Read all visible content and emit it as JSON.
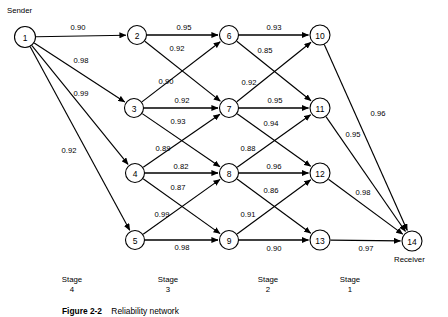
{
  "figure": {
    "sender_label": "Sender",
    "receiver_label": "Receiver",
    "caption_bold": "Figure  2-2",
    "caption_rest": "Reliability network"
  },
  "stages": [
    {
      "name": "Stage",
      "number": "4",
      "x": 72
    },
    {
      "name": "Stage",
      "number": "3",
      "x": 168
    },
    {
      "name": "Stage",
      "number": "2",
      "x": 268
    },
    {
      "name": "Stage",
      "number": "1",
      "x": 350
    }
  ],
  "chart_data": {
    "type": "diagram",
    "title": "Reliability network",
    "nodes": [
      {
        "id": "1",
        "label": "1",
        "x": 25,
        "y": 37,
        "r": 10.5,
        "role": "sender"
      },
      {
        "id": "2",
        "label": "2",
        "x": 137,
        "y": 35,
        "r": 9.5,
        "role": "intermediate"
      },
      {
        "id": "3",
        "label": "3",
        "x": 134,
        "y": 108,
        "r": 9.5,
        "role": "intermediate"
      },
      {
        "id": "4",
        "label": "4",
        "x": 135,
        "y": 173,
        "r": 9.5,
        "role": "intermediate"
      },
      {
        "id": "5",
        "label": "5",
        "x": 135,
        "y": 240,
        "r": 9.5,
        "role": "intermediate"
      },
      {
        "id": "6",
        "label": "6",
        "x": 229,
        "y": 35,
        "r": 9.5,
        "role": "intermediate"
      },
      {
        "id": "7",
        "label": "7",
        "x": 229,
        "y": 108,
        "r": 9.5,
        "role": "intermediate"
      },
      {
        "id": "8",
        "label": "8",
        "x": 229,
        "y": 173,
        "r": 9.5,
        "role": "intermediate"
      },
      {
        "id": "9",
        "label": "9",
        "x": 229,
        "y": 240,
        "r": 9.5,
        "role": "intermediate"
      },
      {
        "id": "10",
        "label": "10",
        "x": 320,
        "y": 35,
        "r": 10,
        "role": "intermediate"
      },
      {
        "id": "11",
        "label": "11",
        "x": 320,
        "y": 108,
        "r": 10,
        "role": "intermediate"
      },
      {
        "id": "12",
        "label": "12",
        "x": 320,
        "y": 173,
        "r": 10,
        "role": "intermediate"
      },
      {
        "id": "13",
        "label": "13",
        "x": 320,
        "y": 240,
        "r": 10,
        "role": "intermediate"
      },
      {
        "id": "14",
        "label": "14",
        "x": 412,
        "y": 241,
        "r": 10,
        "role": "receiver"
      }
    ],
    "edges": [
      {
        "from": "1",
        "to": "2",
        "value": "0.90",
        "lx": 78,
        "ly": 27
      },
      {
        "from": "1",
        "to": "3",
        "value": "0.98",
        "lx": 81,
        "ly": 60
      },
      {
        "from": "1",
        "to": "4",
        "value": "0.99",
        "lx": 81,
        "ly": 93
      },
      {
        "from": "1",
        "to": "5",
        "value": "0.92",
        "lx": 69,
        "ly": 150
      },
      {
        "from": "2",
        "to": "6",
        "value": "0.95",
        "lx": 184,
        "ly": 27
      },
      {
        "from": "2",
        "to": "7",
        "value": "0.92",
        "lx": 177,
        "ly": 48
      },
      {
        "from": "3",
        "to": "6",
        "value": "0.90",
        "lx": 166,
        "ly": 81
      },
      {
        "from": "3",
        "to": "7",
        "value": "0.92",
        "lx": 182,
        "ly": 100
      },
      {
        "from": "3",
        "to": "8",
        "value": "0.93",
        "lx": 178,
        "ly": 121
      },
      {
        "from": "4",
        "to": "7",
        "value": "0.89",
        "lx": 163,
        "ly": 148
      },
      {
        "from": "4",
        "to": "8",
        "value": "0.82",
        "lx": 181,
        "ly": 166
      },
      {
        "from": "4",
        "to": "9",
        "value": "0.87",
        "lx": 178,
        "ly": 187
      },
      {
        "from": "5",
        "to": "8",
        "value": "0.99",
        "lx": 162,
        "ly": 214
      },
      {
        "from": "5",
        "to": "9",
        "value": "0.98",
        "lx": 182,
        "ly": 247
      },
      {
        "from": "6",
        "to": "10",
        "value": "0.93",
        "lx": 274,
        "ly": 27
      },
      {
        "from": "6",
        "to": "11",
        "value": "0.85",
        "lx": 265,
        "ly": 50
      },
      {
        "from": "7",
        "to": "10",
        "value": "0.92",
        "lx": 249,
        "ly": 82
      },
      {
        "from": "7",
        "to": "11",
        "value": "0.95",
        "lx": 275,
        "ly": 100
      },
      {
        "from": "7",
        "to": "12",
        "value": "0.94",
        "lx": 271,
        "ly": 123
      },
      {
        "from": "8",
        "to": "11",
        "value": "0.88",
        "lx": 248,
        "ly": 148
      },
      {
        "from": "8",
        "to": "12",
        "value": "0.96",
        "lx": 274,
        "ly": 166
      },
      {
        "from": "8",
        "to": "13",
        "value": "0.86",
        "lx": 271,
        "ly": 190
      },
      {
        "from": "9",
        "to": "12",
        "value": "0.91",
        "lx": 248,
        "ly": 214
      },
      {
        "from": "9",
        "to": "13",
        "value": "0.90",
        "lx": 274,
        "ly": 248
      },
      {
        "from": "10",
        "to": "14",
        "value": "0.96",
        "lx": 378,
        "ly": 113
      },
      {
        "from": "11",
        "to": "14",
        "value": "0.95",
        "lx": 353,
        "ly": 134
      },
      {
        "from": "12",
        "to": "14",
        "value": "0.98",
        "lx": 363,
        "ly": 192
      },
      {
        "from": "13",
        "to": "14",
        "value": "0.97",
        "lx": 366,
        "ly": 248
      }
    ]
  }
}
